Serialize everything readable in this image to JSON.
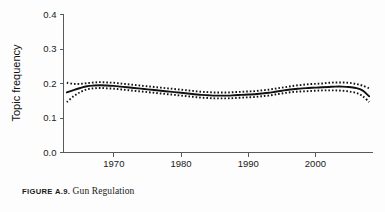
{
  "figure": {
    "caption_label": "FIGURE A.9.",
    "caption_title": "Gun Regulation"
  },
  "chart_data": {
    "type": "line",
    "title": "Gun Regulation",
    "xlabel": "",
    "ylabel": "Topic frequency",
    "xlim": [
      1962.5,
      2008.5
    ],
    "ylim": [
      0.0,
      0.4
    ],
    "grid": false,
    "legend": "none",
    "xticks": [
      1970,
      1980,
      1990,
      2000
    ],
    "xtick_labels": [
      "1970",
      "1980",
      "1990",
      "2000"
    ],
    "yticks": [
      0.0,
      0.1,
      0.2,
      0.3,
      0.4
    ],
    "ytick_labels": [
      "0.0",
      "0.1",
      "0.2",
      "0.3",
      "0.4"
    ],
    "x": [
      1963,
      1964,
      1965,
      1966,
      1967,
      1968,
      1969,
      1970,
      1971,
      1972,
      1973,
      1974,
      1975,
      1976,
      1977,
      1978,
      1979,
      1980,
      1981,
      1982,
      1983,
      1984,
      1985,
      1986,
      1987,
      1988,
      1989,
      1990,
      1991,
      1992,
      1993,
      1994,
      1995,
      1996,
      1997,
      1998,
      1999,
      2000,
      2001,
      2002,
      2003,
      2004,
      2005,
      2006,
      2007,
      2008
    ],
    "series": [
      {
        "name": "Topic frequency (smoothed estimate)",
        "style": "solid",
        "values": [
          0.174,
          0.181,
          0.187,
          0.192,
          0.194,
          0.195,
          0.194,
          0.193,
          0.191,
          0.189,
          0.187,
          0.185,
          0.183,
          0.181,
          0.179,
          0.177,
          0.175,
          0.173,
          0.171,
          0.169,
          0.167,
          0.166,
          0.165,
          0.165,
          0.165,
          0.166,
          0.167,
          0.168,
          0.169,
          0.171,
          0.173,
          0.176,
          0.179,
          0.182,
          0.184,
          0.186,
          0.187,
          0.188,
          0.189,
          0.19,
          0.191,
          0.191,
          0.19,
          0.187,
          0.18,
          0.163
        ]
      },
      {
        "name": "Upper confidence band",
        "style": "dotted",
        "values": [
          0.202,
          0.199,
          0.199,
          0.201,
          0.203,
          0.204,
          0.203,
          0.202,
          0.2,
          0.198,
          0.196,
          0.194,
          0.192,
          0.19,
          0.188,
          0.186,
          0.184,
          0.182,
          0.18,
          0.178,
          0.176,
          0.175,
          0.174,
          0.174,
          0.174,
          0.175,
          0.176,
          0.177,
          0.178,
          0.18,
          0.182,
          0.185,
          0.188,
          0.191,
          0.194,
          0.196,
          0.198,
          0.199,
          0.2,
          0.202,
          0.203,
          0.203,
          0.202,
          0.199,
          0.194,
          0.186
        ]
      },
      {
        "name": "Lower confidence band",
        "style": "dotted",
        "values": [
          0.146,
          0.163,
          0.175,
          0.183,
          0.186,
          0.187,
          0.186,
          0.185,
          0.183,
          0.181,
          0.179,
          0.177,
          0.175,
          0.173,
          0.171,
          0.169,
          0.167,
          0.165,
          0.163,
          0.161,
          0.159,
          0.158,
          0.157,
          0.157,
          0.157,
          0.158,
          0.159,
          0.16,
          0.161,
          0.163,
          0.165,
          0.168,
          0.171,
          0.174,
          0.176,
          0.177,
          0.178,
          0.179,
          0.18,
          0.18,
          0.18,
          0.179,
          0.177,
          0.173,
          0.164,
          0.146
        ]
      }
    ]
  }
}
